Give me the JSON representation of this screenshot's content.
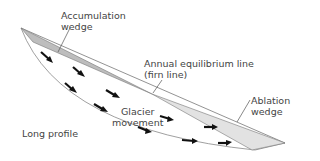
{
  "labels": {
    "accumulation_1": "Accumulation",
    "accumulation_2": "wedge",
    "ela_1": "Annual equilibrium line",
    "ela_2": "(firn line)",
    "glacier_1": "Glacier",
    "glacier_2": "movement",
    "ablation_1": "Ablation",
    "ablation_2": "wedge",
    "long_profile": "Long profile"
  },
  "colors": {
    "accumulation_fill": "#bdbdbd",
    "ablation_fill": "#e2e2e2",
    "outline": "#777777",
    "arrow": "#111111",
    "text": "#444444"
  }
}
